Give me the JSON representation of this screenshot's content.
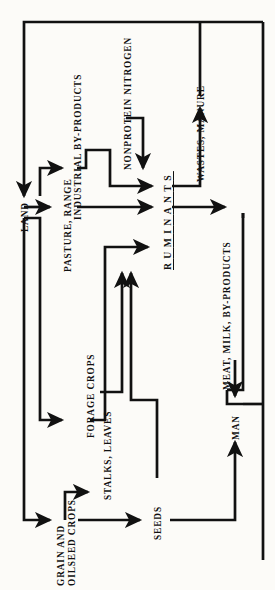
{
  "diagram": {
    "orientation": "rotated-90-ccw",
    "nodes": {
      "land": "LAND",
      "pasture_range": "PASTURE, RANGE",
      "industrial_byproducts": "INDUSTRIAL BY-PRODUCTS",
      "nonprotein_nitrogen": "NONPROTEIN NITROGEN",
      "ruminants": "RUMINANTS",
      "wastes_manure": "WASTES, MANURE",
      "meat_milk_byproducts": "MEAT, MILK, BY-PRODUCTS",
      "man": "MAN",
      "forage_crops": "FORAGE CROPS",
      "stalks_leaves": "STALKS, LEAVES",
      "grain_oilseed_crops_line1": "GRAIN AND",
      "grain_oilseed_crops_line2": "OILSEED CROPS",
      "seeds": "SEEDS"
    },
    "edges": [
      {
        "from": "LAND",
        "to": "PASTURE, RANGE"
      },
      {
        "from": "LAND",
        "to": "FORAGE CROPS"
      },
      {
        "from": "LAND",
        "to": "GRAIN AND OILSEED CROPS"
      },
      {
        "from": "PASTURE, RANGE",
        "to": "RUMINANTS"
      },
      {
        "from": "INDUSTRIAL BY-PRODUCTS",
        "to": "RUMINANTS"
      },
      {
        "from": "NONPROTEIN NITROGEN",
        "to": "RUMINANTS"
      },
      {
        "from": "FORAGE CROPS",
        "to": "RUMINANTS"
      },
      {
        "from": "STALKS, LEAVES",
        "to": "RUMINANTS"
      },
      {
        "from": "SEEDS",
        "to": "RUMINANTS"
      },
      {
        "from": "GRAIN AND OILSEED CROPS",
        "to": "STALKS, LEAVES"
      },
      {
        "from": "GRAIN AND OILSEED CROPS",
        "to": "SEEDS"
      },
      {
        "from": "RUMINANTS",
        "to": "WASTES, MANURE"
      },
      {
        "from": "RUMINANTS",
        "to": "MEAT, MILK, BY-PRODUCTS"
      },
      {
        "from": "MEAT, MILK, BY-PRODUCTS",
        "to": "MAN"
      },
      {
        "from": "SEEDS",
        "to": "MAN"
      },
      {
        "from": "WASTES, MANURE",
        "to": "LAND"
      },
      {
        "from": "MAN",
        "to": "LAND"
      }
    ],
    "colors": {
      "ink": "#111111",
      "paper": "#fcfbf8"
    }
  }
}
